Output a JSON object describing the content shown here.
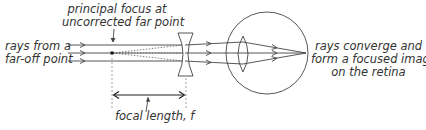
{
  "labels": {
    "principal_focus_line1": "principal focus at",
    "principal_focus_line2": "uncorrected far point",
    "rays_from_line1": "rays from a",
    "rays_from_line2": "far-off point",
    "converge_line1": "rays converge and",
    "converge_line2": "form a focused image",
    "converge_line3": "on the retina",
    "focal_length": "focal length, f"
  },
  "colors": {
    "line": "#444444",
    "text": "#333333",
    "dashed": "#888888"
  }
}
